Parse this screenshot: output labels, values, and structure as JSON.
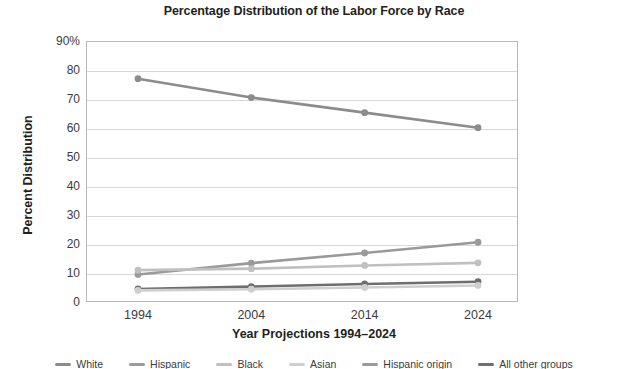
{
  "chart_data": {
    "type": "line",
    "title": "Percentage Distribution of the Labor Force by Race",
    "xlabel": "Year Projections 1994–2024",
    "ylabel": "Percent Distribution",
    "categories": [
      "1994",
      "2004",
      "2014",
      "2024"
    ],
    "x": [
      1994,
      2004,
      2014,
      2024
    ],
    "ylim": [
      0,
      90
    ],
    "yticks": [
      "0",
      "10",
      "20",
      "30",
      "40",
      "50",
      "60",
      "70",
      "80",
      "90%"
    ],
    "ytick_values": [
      0,
      10,
      20,
      30,
      40,
      50,
      60,
      70,
      80,
      90
    ],
    "grid": true,
    "legend_position": "bottom",
    "series": [
      {
        "name": "White",
        "color": "#8c8c8c",
        "values": [
          77.0,
          70.5,
          65.3,
          60.1
        ]
      },
      {
        "name": "Hispanic origin",
        "color": "#9a9a9a",
        "values": [
          9.5,
          13.4,
          16.9,
          20.6
        ]
      },
      {
        "name": "Black",
        "color": "#c0c0c0",
        "values": [
          11.0,
          11.5,
          12.6,
          13.5
        ]
      },
      {
        "name": "All other groups",
        "color": "#6e6e6e",
        "values": [
          4.5,
          5.3,
          6.2,
          7.0
        ]
      },
      {
        "name": "Asian",
        "color": "#cfcfcf",
        "values": [
          4.0,
          4.4,
          5.0,
          5.7
        ]
      }
    ]
  },
  "legend": {
    "items": [
      {
        "label": "White",
        "color": "#8c8c8c"
      },
      {
        "label": "Hispanic",
        "color": "#9a9a9a"
      },
      {
        "label": "Black",
        "color": "#c0c0c0"
      },
      {
        "label": "Asian",
        "color": "#cfcfcf"
      },
      {
        "label": "Hispanic origin",
        "color": "#9a9a9a"
      },
      {
        "label": "All other groups",
        "color": "#6e6e6e"
      }
    ]
  }
}
